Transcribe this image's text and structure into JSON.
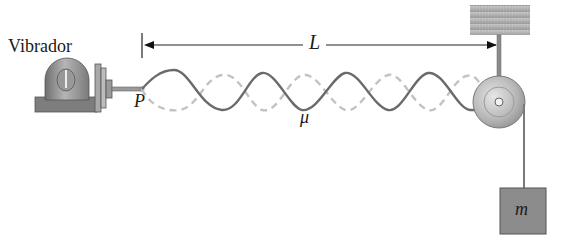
{
  "diagram": {
    "type": "physics-standing-wave-setup",
    "labels": {
      "vibrator": "Vibrador",
      "length": "L",
      "point": "P",
      "linear_density": "μ",
      "mass": "m"
    },
    "components": [
      {
        "name": "vibrator",
        "description": "Mechanical oscillator driving the string at point P"
      },
      {
        "name": "string",
        "description": "String of linear mass density μ showing a standing wave (solid and dashed envelopes)"
      },
      {
        "name": "length-arrow",
        "description": "Double-headed dimension arrow indicating length L from P to the pulley"
      },
      {
        "name": "pulley",
        "description": "Pulley attached to ceiling support"
      },
      {
        "name": "ceiling-support",
        "description": "Fixed hatched support block"
      },
      {
        "name": "hanging-mass",
        "description": "Block of mass m providing tension"
      }
    ],
    "colors": {
      "string": "#6e6e6e",
      "dashed_wave": "#bdbdbd",
      "metal": "#8a8a8a",
      "mass_fill": "#8c8c8c",
      "support_fill": "#a6a6a6",
      "text": "#1a1a1a"
    },
    "wave": {
      "half_wavelengths": 7,
      "start_x": 142,
      "end_x": 477
    }
  }
}
